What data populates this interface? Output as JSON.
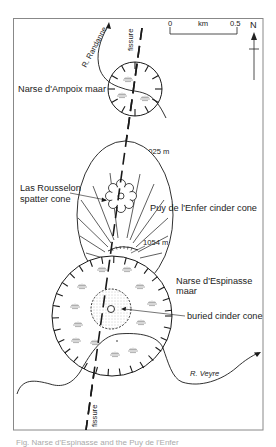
{
  "figure": {
    "labels": {
      "ampoix": "Narse d'Ampoix maar",
      "rousselon_1": "Las Rousselon",
      "rousselon_2": "spatter cone",
      "enfer": "Puy de l'Enfer cinder cone",
      "espinasse_1": "Narse d'Espinasse",
      "espinasse_2": "maar",
      "buried": "buried cinder cone",
      "fissure_top": "fissure",
      "fissure_bottom": "fissure",
      "river_1": "R. Randanne",
      "river_2": "R. Veyre",
      "elev_1": "1025 m",
      "elev_2": "1054 m"
    },
    "scale_bar": {
      "start": "0",
      "unit": "km",
      "end": "0.5"
    },
    "north": "N",
    "caption": "Fig. Narse d'Espinasse and the Puy de l'Enfer"
  },
  "colors": {
    "ink": "#1a1a1a",
    "frame": "#888888",
    "stipple": "#9a9a9a",
    "marsh": "#999999"
  }
}
